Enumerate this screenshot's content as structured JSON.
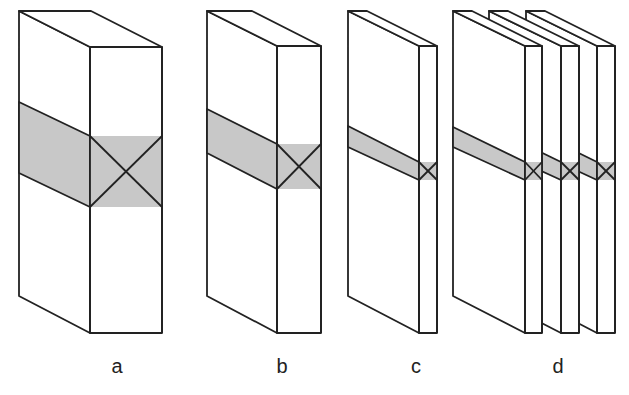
{
  "labels": {
    "a": "a",
    "b": "b",
    "c": "c",
    "d": "d"
  },
  "colors": {
    "stroke": "#222222",
    "band": "#c8c8c8",
    "face": "#ffffff"
  }
}
